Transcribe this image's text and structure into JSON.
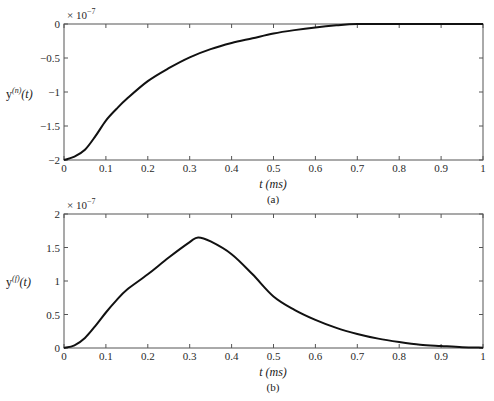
{
  "chart_data": [
    {
      "type": "line",
      "id": "a",
      "title": "",
      "caption": "(a)",
      "xlabel": "t (ms)",
      "ylabel": "y^(n)(t)",
      "ylabel_main": "y",
      "ylabel_sup": "(n)",
      "ylabel_tail": "(t)",
      "exponent_label": "× 10",
      "exponent_power": "−7",
      "xlim": [
        0,
        1
      ],
      "ylim": [
        -2,
        0
      ],
      "grid": false,
      "xticks": [
        0,
        0.1,
        0.2,
        0.3,
        0.4,
        0.5,
        0.6,
        0.7,
        0.8,
        0.9,
        1
      ],
      "xtick_labels": [
        "0",
        "0.1",
        "0.2",
        "0.3",
        "0.4",
        "0.5",
        "0.6",
        "0.7",
        "0.8",
        "0.9",
        "1"
      ],
      "yticks": [
        0,
        -0.5,
        -1,
        -1.5,
        -2
      ],
      "ytick_labels": [
        "0",
        "−0.5",
        "−1",
        "−1.5",
        "−2"
      ],
      "line_color": "#111111",
      "series": [
        {
          "name": "y(n)(t)",
          "x": [
            0,
            0.025,
            0.05,
            0.075,
            0.1,
            0.125,
            0.15,
            0.2,
            0.25,
            0.3,
            0.35,
            0.4,
            0.45,
            0.5,
            0.55,
            0.6,
            0.65,
            0.7,
            0.8,
            0.9,
            1.0
          ],
          "values": [
            -2.0,
            -1.95,
            -1.85,
            -1.65,
            -1.42,
            -1.25,
            -1.1,
            -0.84,
            -0.65,
            -0.49,
            -0.37,
            -0.28,
            -0.21,
            -0.14,
            -0.09,
            -0.05,
            -0.02,
            0.0,
            0.0,
            0.0,
            0.0
          ]
        }
      ]
    },
    {
      "type": "line",
      "id": "b",
      "title": "",
      "caption": "(b)",
      "xlabel": "t (ms)",
      "ylabel": "y^(f)(t)",
      "ylabel_main": "y",
      "ylabel_sup": "(f)",
      "ylabel_tail": "(t)",
      "exponent_label": "× 10",
      "exponent_power": "−7",
      "xlim": [
        0,
        1
      ],
      "ylim": [
        0,
        2
      ],
      "grid": false,
      "xticks": [
        0,
        0.1,
        0.2,
        0.3,
        0.4,
        0.5,
        0.6,
        0.7,
        0.8,
        0.9,
        1
      ],
      "xtick_labels": [
        "0",
        "0.1",
        "0.2",
        "0.3",
        "0.4",
        "0.5",
        "0.6",
        "0.7",
        "0.8",
        "0.9",
        "1"
      ],
      "yticks": [
        0,
        0.5,
        1,
        1.5,
        2
      ],
      "ytick_labels": [
        "0",
        "0.5",
        "1",
        "1.5",
        "2"
      ],
      "line_color": "#111111",
      "series": [
        {
          "name": "y(f)(t)",
          "x": [
            0,
            0.025,
            0.05,
            0.075,
            0.1,
            0.125,
            0.15,
            0.2,
            0.25,
            0.3,
            0.32,
            0.35,
            0.4,
            0.45,
            0.5,
            0.55,
            0.6,
            0.65,
            0.7,
            0.75,
            0.8,
            0.85,
            0.9,
            0.95,
            1.0
          ],
          "values": [
            0.0,
            0.04,
            0.15,
            0.33,
            0.53,
            0.71,
            0.87,
            1.1,
            1.35,
            1.58,
            1.65,
            1.59,
            1.4,
            1.1,
            0.77,
            0.57,
            0.42,
            0.3,
            0.21,
            0.14,
            0.09,
            0.05,
            0.03,
            0.012,
            0.005
          ]
        }
      ]
    }
  ]
}
